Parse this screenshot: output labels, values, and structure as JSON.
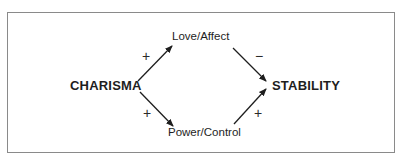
{
  "diagram": {
    "type": "causal-diagram",
    "nodes": {
      "charisma": {
        "label": "CHARISMA"
      },
      "stability": {
        "label": "STABILITY"
      },
      "love_affect": {
        "label": "Love/Affect"
      },
      "power_control": {
        "label": "Power/Control"
      }
    },
    "edges": [
      {
        "from": "CHARISMA",
        "to": "Love/Affect",
        "sign": "+"
      },
      {
        "from": "CHARISMA",
        "to": "Power/Control",
        "sign": "+"
      },
      {
        "from": "Love/Affect",
        "to": "STABILITY",
        "sign": "−"
      },
      {
        "from": "Power/Control",
        "to": "STABILITY",
        "sign": "+"
      }
    ],
    "colors": {
      "border": "#8a8a8a",
      "arrow": "#1e1e1e",
      "text": "#1e1e1e",
      "background": "#ffffff"
    }
  }
}
